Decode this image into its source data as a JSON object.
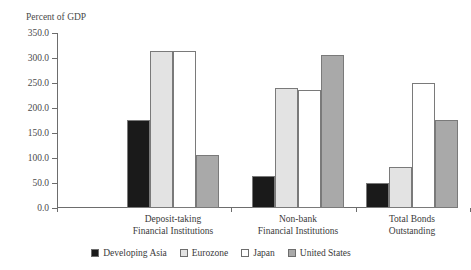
{
  "title_remnant": "",
  "axis_title": "Percent of GDP",
  "chart_data": {
    "type": "bar",
    "title": "",
    "subtitle": "",
    "xlabel": "",
    "ylabel": "Percent of GDP",
    "ylim": [
      0,
      350
    ],
    "ytick_step": 50,
    "ytick_labels": [
      "0.0",
      "50.0",
      "100.0",
      "150.0",
      "200.0",
      "250.0",
      "300.0",
      "350.0"
    ],
    "ytick_values": [
      0,
      50,
      100,
      150,
      200,
      250,
      300,
      350
    ],
    "grid": false,
    "legend_position": "bottom",
    "categories": [
      "Deposit-taking\nFinancial Institutions",
      "Non-bank\nFinancial Institutions",
      "Total Bonds\nOutstanding"
    ],
    "category_lines": [
      [
        "Deposit-taking",
        "Financial Institutions"
      ],
      [
        "Non-bank",
        "Financial Institutions"
      ],
      [
        "Total Bonds",
        "Outstanding"
      ]
    ],
    "series": [
      {
        "name": "Developing Asia",
        "color": "#1a1a1a",
        "values": [
          176,
          64,
          51
        ]
      },
      {
        "name": "Eurozone",
        "color": "#e3e3e3",
        "values": [
          315,
          240,
          82
        ]
      },
      {
        "name": "Japan",
        "color": "#ffffff",
        "values": [
          314,
          236,
          250
        ]
      },
      {
        "name": "United States",
        "color": "#a9a9a9",
        "values": [
          106,
          306,
          177
        ]
      }
    ]
  }
}
